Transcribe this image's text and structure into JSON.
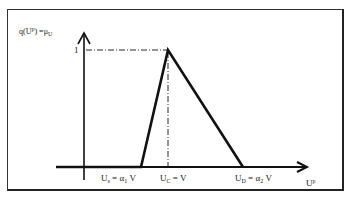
{
  "diagram": {
    "type": "triangular-membership-function",
    "y_axis_label": {
      "base": "q(U",
      "sup": "p",
      "mid": ") =μ",
      "sub": "U"
    },
    "peak_label": "1",
    "x_axis_label": {
      "base": "U",
      "sup": "p"
    },
    "tick_labels": [
      {
        "base": "U",
        "sub": "s",
        "rest": " = α",
        "sub2": "1",
        "tail": " V"
      },
      {
        "base": "U",
        "sub": "C",
        "rest": " = V",
        "sub2": "",
        "tail": ""
      },
      {
        "base": "U",
        "sub": "D",
        "rest": " = α",
        "sub2": "2",
        "tail": " V"
      }
    ],
    "colors": {
      "line": "#111111",
      "frame": "#333333"
    }
  }
}
